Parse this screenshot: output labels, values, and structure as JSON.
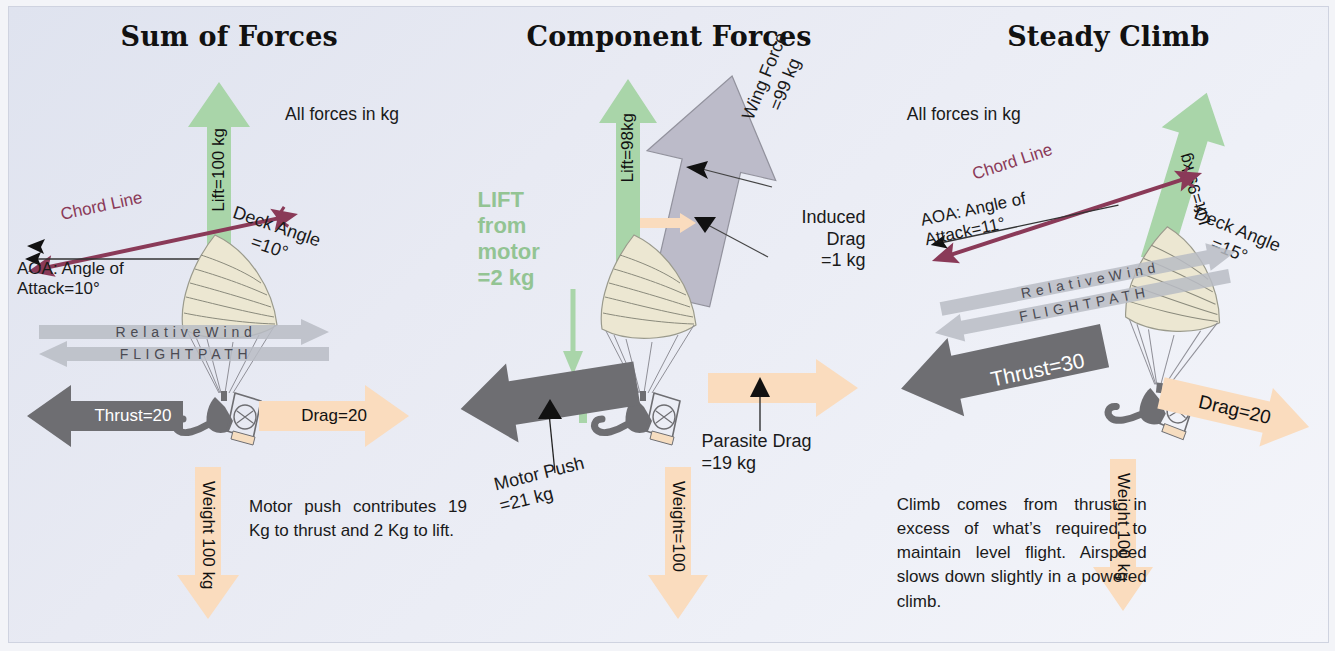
{
  "figure": {
    "type": "force-diagram",
    "units_note": "All forces in kg"
  },
  "panels": [
    {
      "id": "sum-of-forces",
      "title": "Sum of Forces",
      "note": "All forces\nin kg",
      "labels": {
        "lift": "Lift=100 kg",
        "chord_line": "Chord Line",
        "deck_angle": "Deck Angle\n=10°",
        "aoa": "AOA: Angle of\nAttack=10°",
        "relative_wind": "R e l a t i v e  W i n d",
        "flight_path": "F L I G H T   P A T H",
        "thrust": "Thrust=20",
        "drag": "Drag=20",
        "weight": "Weight 100 kg"
      },
      "caption": "Motor push con­tributes 19 Kg to thrust and 2 Kg to lift.",
      "values": {
        "lift_kg": 100,
        "deck_angle_deg": 10,
        "aoa_deg": 10,
        "thrust_kg": 20,
        "drag_kg": 20,
        "weight_kg": 100
      }
    },
    {
      "id": "component-forces",
      "title": "Component Forces",
      "labels": {
        "lift": "Lift=98kg",
        "lift_from_motor": "LIFT\nfrom\nmotor\n=2 kg",
        "wing_force": "Wing Force\n=99 kg",
        "induced_drag": "Induced\nDrag\n=1 kg",
        "parasite_drag": "Parasite Drag\n=19 kg",
        "motor_push": "Motor Push\n=21 kg",
        "weight": "Weight=100"
      },
      "values": {
        "lift_kg": 98,
        "lift_from_motor_kg": 2,
        "wing_force_kg": 99,
        "induced_drag_kg": 1,
        "parasite_drag_kg": 19,
        "motor_push_kg": 21,
        "weight_kg": 100
      }
    },
    {
      "id": "steady-climb",
      "title": "Steady Climb",
      "note": "All forces\nin kg",
      "labels": {
        "lift": "Lift=99 kg",
        "chord_line": "Chord Line",
        "deck_angle": "Deck Angle\n=15°",
        "aoa": "AOA: Angle of\nAttack=11°",
        "relative_wind": "R e l a t i v e  W i n d",
        "flight_path": "F L I G H T   P A T H",
        "thrust": "Thrust=30",
        "drag": "Drag=20",
        "weight": "Weight 100 kg"
      },
      "caption": "Climb comes from thrust in excess of what’s required to maintain level flight. Airspeed slows down slightly in a powered climb.",
      "values": {
        "lift_kg": 99,
        "deck_angle_deg": 15,
        "aoa_deg": 11,
        "thrust_kg": 30,
        "drag_kg": 20,
        "weight_kg": 100
      }
    }
  ],
  "colors": {
    "lift_green": "#a9d5a9",
    "drag_peach": "#fadcbe",
    "thrust_gray": "#6e6e6e",
    "wind_gray": "#b9bcc4",
    "chord_maroon": "#8a3a58",
    "wing_ivory": "#ece7d2",
    "background": "#e7e9f2",
    "motor_lift_green_text": "#93c493"
  }
}
